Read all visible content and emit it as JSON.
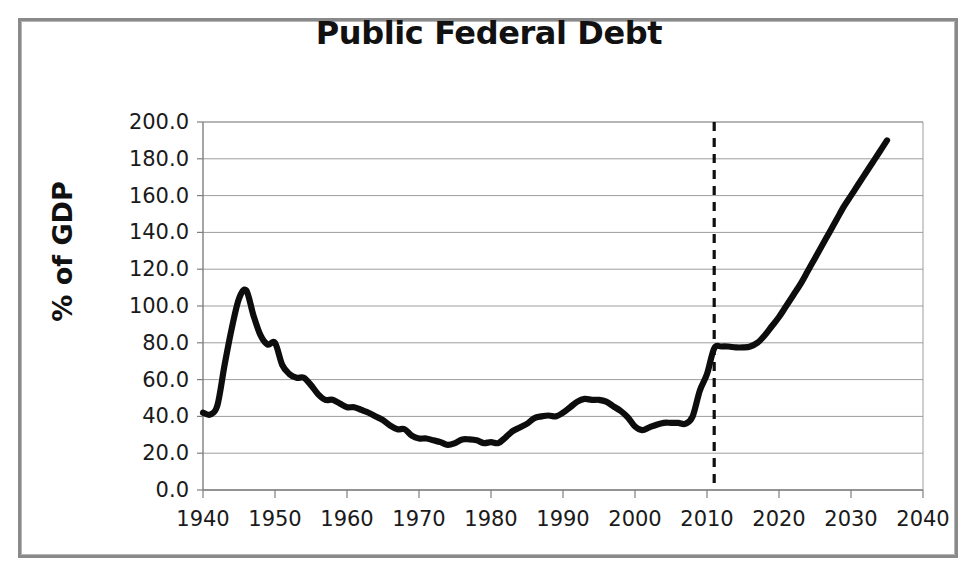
{
  "figure": {
    "title": "Public Federal Debt",
    "frame_color": "#8a8a8a",
    "background": "#ffffff"
  },
  "chart_data": {
    "type": "line",
    "title": "Public Federal Debt",
    "xlabel": "",
    "ylabel": "% of GDP",
    "xlim": [
      1940,
      2040
    ],
    "ylim": [
      0,
      200
    ],
    "grid": true,
    "legend": false,
    "line_color": "#0d0d0d",
    "x_ticks": [
      1940,
      1950,
      1960,
      1970,
      1980,
      1990,
      2000,
      2010,
      2020,
      2030,
      2040
    ],
    "x_tick_labels": [
      "1940",
      "1950",
      "1960",
      "1970",
      "1980",
      "1990",
      "2000",
      "2010",
      "2020",
      "2030",
      "2040"
    ],
    "y_ticks": [
      0,
      20,
      40,
      60,
      80,
      100,
      120,
      140,
      160,
      180,
      200
    ],
    "y_tick_labels": [
      "0.0",
      "20.0",
      "40.0",
      "60.0",
      "80.0",
      "100.0",
      "120.0",
      "140.0",
      "160.0",
      "180.0",
      "200.0"
    ],
    "annotations": [
      {
        "name": "projection-divider",
        "type": "vertical-dashed-line",
        "x": 2011,
        "style": "dashed",
        "color": "#101010"
      }
    ],
    "series": [
      {
        "name": "Public Federal Debt",
        "x": [
          1940,
          1941,
          1942,
          1943,
          1944,
          1945,
          1946,
          1947,
          1948,
          1949,
          1950,
          1951,
          1952,
          1953,
          1954,
          1955,
          1956,
          1957,
          1958,
          1959,
          1960,
          1961,
          1962,
          1963,
          1964,
          1965,
          1966,
          1967,
          1968,
          1969,
          1970,
          1971,
          1972,
          1973,
          1974,
          1975,
          1976,
          1977,
          1978,
          1979,
          1980,
          1981,
          1982,
          1983,
          1984,
          1985,
          1986,
          1987,
          1988,
          1989,
          1990,
          1991,
          1992,
          1993,
          1994,
          1995,
          1996,
          1997,
          1998,
          1999,
          2000,
          2001,
          2002,
          2003,
          2004,
          2005,
          2006,
          2007,
          2008,
          2009,
          2010,
          2011,
          2012,
          2013,
          2014,
          2015,
          2016,
          2017,
          2018,
          2019,
          2020,
          2021,
          2022,
          2023,
          2024,
          2025,
          2026,
          2027,
          2028,
          2029,
          2030,
          2031,
          2032,
          2033,
          2034,
          2035
        ],
        "values": [
          42.0,
          41.0,
          46.0,
          68.0,
          88.0,
          104.0,
          108.5,
          95.0,
          84.0,
          79.0,
          80.0,
          68.0,
          63.0,
          61.0,
          61.0,
          57.0,
          52.0,
          49.0,
          49.0,
          47.0,
          45.0,
          45.0,
          43.5,
          42.0,
          40.0,
          38.0,
          35.0,
          33.0,
          33.0,
          29.5,
          28.0,
          28.0,
          27.0,
          26.0,
          24.5,
          25.5,
          27.5,
          27.5,
          27.0,
          25.5,
          26.0,
          25.5,
          28.5,
          32.0,
          34.0,
          36.0,
          39.0,
          40.0,
          40.5,
          40.0,
          42.0,
          45.0,
          48.0,
          49.5,
          49.0,
          49.0,
          48.0,
          45.5,
          43.0,
          39.5,
          34.5,
          32.5,
          34.0,
          35.5,
          36.5,
          36.5,
          36.5,
          36.0,
          40.0,
          54.0,
          63.0,
          77.0,
          78.0,
          78.0,
          77.5,
          77.5,
          78.0,
          80.0,
          84.0,
          89.0,
          94.0,
          100.0,
          106.0,
          112.0,
          119.0,
          126.0,
          133.0,
          140.0,
          147.0,
          154.0,
          160.0,
          166.0,
          172.0,
          178.0,
          184.0,
          190.0
        ]
      }
    ]
  }
}
